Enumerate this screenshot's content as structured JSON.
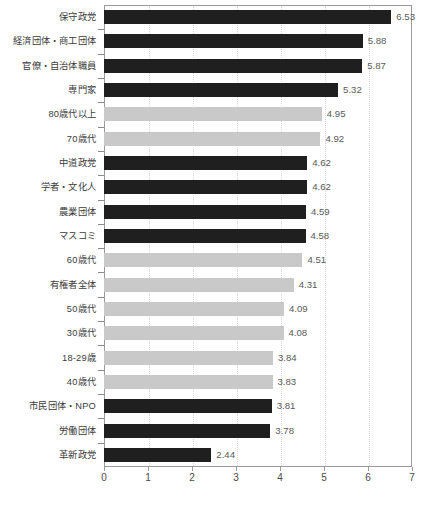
{
  "chart_data": {
    "type": "bar",
    "orientation": "horizontal",
    "title": "",
    "subtitle": "",
    "xlabel": "",
    "ylabel": "",
    "xlim": [
      0,
      7
    ],
    "xticks": [
      "0",
      "1",
      "2",
      "3",
      "4",
      "5",
      "6",
      "7"
    ],
    "grid": true,
    "legend": "none",
    "colors": {
      "dark_bar": "#1f1f1f",
      "light_bar": "#c9c9c9",
      "axis": "#9a9a9a",
      "gridline": "#d8d8d8",
      "label_text": "#3c3c3c",
      "value_text": "#5a5a5a",
      "background": "#ffffff"
    },
    "categories": [
      "保守政党",
      "経済団体・商工団体",
      "官僚・自治体職員",
      "専門家",
      "80歳代以上",
      "70歳代",
      "中道政党",
      "学者・文化人",
      "農業団体",
      "マスコミ",
      "60歳代",
      "有権者全体",
      "50歳代",
      "30歳代",
      "18-29歳",
      "40歳代",
      "市民団体・NPO",
      "労働団体",
      "革新政党"
    ],
    "values": [
      6.53,
      5.88,
      5.87,
      5.32,
      4.95,
      4.92,
      4.62,
      4.62,
      4.59,
      4.58,
      4.51,
      4.31,
      4.09,
      4.08,
      3.84,
      3.83,
      3.81,
      3.78,
      2.44
    ],
    "value_labels": [
      "6.53",
      "5.88",
      "5.87",
      "5.32",
      "4.95",
      "4.92",
      "4.62",
      "4.62",
      "4.59",
      "4.58",
      "4.51",
      "4.31",
      "4.09",
      "4.08",
      "3.84",
      "3.83",
      "3.81",
      "3.78",
      "2.44"
    ],
    "bar_styles": [
      "dark",
      "dark",
      "dark",
      "dark",
      "light",
      "light",
      "dark",
      "dark",
      "dark",
      "dark",
      "light",
      "light",
      "light",
      "light",
      "light",
      "light",
      "dark",
      "dark",
      "dark"
    ]
  }
}
